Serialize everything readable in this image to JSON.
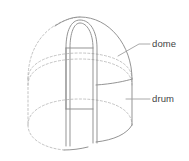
{
  "figure": {
    "background_color": "#ffffff",
    "line_color": "#888888",
    "hidden_line_color": "#b5b5b5",
    "leader_color": "#9a9a9a",
    "text_color": "#444444",
    "callouts": [
      {
        "id": "dome",
        "label": "dome",
        "label_x": 152,
        "label_y": 44,
        "leader": "M118,55 L139,44 L150,44"
      },
      {
        "id": "drum",
        "label": "drum",
        "label_x": 152,
        "label_y": 99,
        "leader": "M126,99 L150,99"
      }
    ],
    "geometry": {
      "dome_outline": "M30,80 C30,38 56,17 81,17 C107,17 133,38 133,80",
      "dome_outline_hidden": "M30,80 C30,38 56,17 81,17",
      "drum_left": "M30,80 L30,124",
      "drum_right": "M133,80 L133,124",
      "ellipse_top_solid": "M30,80 C30,96 53,105 81,105 C110,105 133,96 133,80",
      "ellipse_top_hidden": "M30,80 C30,64 53,56 81,56 C110,56 133,64 133,80",
      "ellipse_bottom_solid": "M30,124 C30,140 53,149 81,149 C110,149 133,140 133,124",
      "ellipse_bottom_hidden": "M30,124 C30,108 53,100 81,100 C110,100 133,108 133,124",
      "arch_outer": "M66,143 L66,45 C66,27 72,18 81,18 C90,18 96,27 96,45 L96,143",
      "arch_inner": "M70,143 L70,45 C70,29 74,21 81,21 C88,21 92,29 92,45 L92,143",
      "door_sill": "M66,108 L96,108",
      "door_head": "M66,46 L96,46"
    }
  }
}
